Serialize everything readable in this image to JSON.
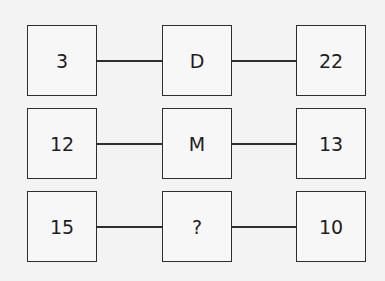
{
  "puzzle": {
    "rows": [
      {
        "left": "3",
        "middle": "D",
        "right": "22"
      },
      {
        "left": "12",
        "middle": "M",
        "right": "13"
      },
      {
        "left": "15",
        "middle": "?",
        "right": "10"
      }
    ]
  },
  "colors": {
    "background": "#f3f3f3",
    "stroke": "#2e2e2e",
    "text": "#1e1e1e"
  }
}
